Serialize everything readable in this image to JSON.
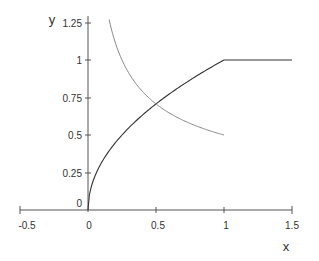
{
  "chart_data": {
    "type": "line",
    "title": "",
    "xlabel": "x",
    "ylabel": "y",
    "xlim": [
      -0.5,
      1.5
    ],
    "ylim": [
      0,
      1.3
    ],
    "grid": false,
    "legend": null,
    "x_ticks": [
      "-0.5",
      "0",
      "0.5",
      "1",
      "1.5"
    ],
    "y_ticks": [
      "0",
      "0.25",
      "0.5",
      "0.75",
      "1",
      "1.25"
    ],
    "series": [
      {
        "name": "sqrt(x) capped at 1",
        "color": "#333333",
        "x": [
          0,
          0.0625,
          0.25,
          0.5,
          0.75,
          1.0,
          1.5
        ],
        "y": [
          0,
          0.25,
          0.5,
          0.707,
          0.866,
          1.0,
          1.0
        ]
      },
      {
        "name": "1/(2*sqrt(x))",
        "color": "#777777",
        "x": [
          0.155,
          0.25,
          0.5,
          0.75,
          1.0
        ],
        "y": [
          1.27,
          1.0,
          0.707,
          0.577,
          0.5
        ]
      }
    ]
  },
  "axes": {
    "x_title": "x",
    "y_title": "y",
    "x_tick_labels": [
      "-0.5",
      "0",
      "0.5",
      "1",
      "1.5"
    ],
    "y_tick_labels": [
      "0",
      "0.25",
      "0.5",
      "0.75",
      "1",
      "1.25"
    ]
  }
}
